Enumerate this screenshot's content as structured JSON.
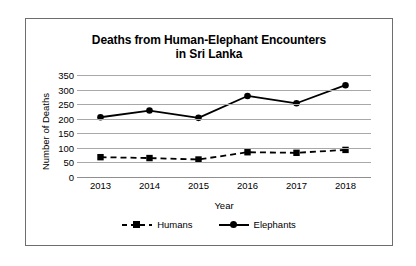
{
  "chart_data": {
    "type": "line",
    "title": "Deaths from Human-Elephant Encounters in Sri Lanka",
    "title_line1": "Deaths from Human-Elephant Encounters",
    "title_line2": "in Sri Lanka",
    "xlabel": "Year",
    "ylabel": "Number of Deaths",
    "categories": [
      "2013",
      "2014",
      "2015",
      "2016",
      "2017",
      "2018"
    ],
    "ylim": [
      0,
      350
    ],
    "yticks": [
      350,
      300,
      250,
      200,
      150,
      100,
      50,
      0
    ],
    "grid": true,
    "legend_position": "bottom-center",
    "series": [
      {
        "name": "Humans",
        "values": [
          68,
          65,
          60,
          85,
          83,
          93
        ],
        "line_style": "dashed",
        "marker": "square",
        "color": "#000000"
      },
      {
        "name": "Elephants",
        "values": [
          205,
          228,
          203,
          278,
          253,
          315
        ],
        "line_style": "solid",
        "marker": "circle",
        "color": "#000000"
      }
    ]
  }
}
